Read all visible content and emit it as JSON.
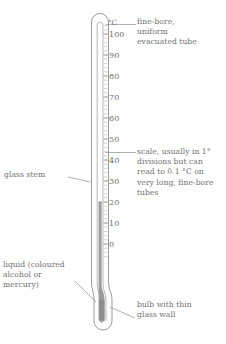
{
  "figure": {
    "name": "laboratory-thermometer-diagram",
    "colors": {
      "outline": "#8a8a8a",
      "text": "#6f6f6f",
      "liquid": "#9a9a9a",
      "liquid_dark": "#878787",
      "tube_fill": "#fdfdfd",
      "leader": "#8f8f8f",
      "background": "#ffffff"
    }
  },
  "scale": {
    "unit_label": "°C",
    "ticks": [
      {
        "value": "100",
        "y": 34
      },
      {
        "value": "90",
        "y": 55
      },
      {
        "value": "80",
        "y": 76
      },
      {
        "value": "70",
        "y": 97
      },
      {
        "value": "60",
        "y": 118
      },
      {
        "value": "50",
        "y": 139
      },
      {
        "value": "40",
        "y": 160
      },
      {
        "value": "30",
        "y": 181
      },
      {
        "value": "20",
        "y": 202
      },
      {
        "value": "10",
        "y": 223
      },
      {
        "value": "0",
        "y": 244
      }
    ],
    "minor_division": "1 degree",
    "reading_top_value": "20"
  },
  "annotations": {
    "fine_bore": "fine-bore,\nuniform\nevacuated tube",
    "scale_note": "scale, usually in 1°\ndivisions but can\nread to 0.1 °C on\nvery long, fine-bore\ntubes",
    "glass_stem": "glass stem",
    "liquid": "liquid (coloured\nalcohol or\nmercury)",
    "bulb": "bulb with thin\nglass wall"
  }
}
